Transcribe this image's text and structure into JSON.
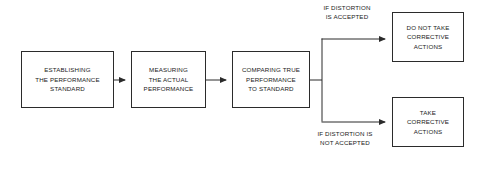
{
  "diagram": {
    "type": "flowchart",
    "orientation": "left-to-right",
    "background_color": "#ffffff",
    "line_color": "#2b2b2b",
    "text_color": "#1a1a1a",
    "nodes": [
      {
        "id": "establish",
        "shape": "rectangle",
        "lines": [
          "ESTABLISHING",
          "THE PERFORMANCE",
          "STANDARD"
        ]
      },
      {
        "id": "measure",
        "shape": "rectangle",
        "lines": [
          "MEASURING",
          "THE ACTUAL",
          "PERFORMANCE"
        ]
      },
      {
        "id": "compare",
        "shape": "rectangle",
        "lines": [
          "COMPARING TRUE",
          "PERFORMANCE",
          "TO STANDARD"
        ]
      },
      {
        "id": "no_action",
        "shape": "rectangle",
        "lines": [
          "DO NOT TAKE",
          "CORRECTIVE",
          "ACTIONS"
        ]
      },
      {
        "id": "action",
        "shape": "rectangle",
        "lines": [
          "TAKE",
          "CORRECTIVE",
          "ACTIONS"
        ]
      }
    ],
    "edge_labels": [
      {
        "id": "accepted",
        "lines": [
          "IF DISTORTION",
          "IS ACCEPTED"
        ]
      },
      {
        "id": "not_accepted",
        "lines": [
          "IF DISTORTION IS",
          "NOT ACCEPTED"
        ]
      }
    ],
    "connectors": [
      {
        "id": "establish-to-measure",
        "from": "establish",
        "to": "measure",
        "style": "arrow"
      },
      {
        "id": "measure-to-compare",
        "from": "measure",
        "to": "compare",
        "style": "arrow"
      },
      {
        "id": "compare-to-branch",
        "from": "compare",
        "to": "branch-trunk",
        "style": "line"
      },
      {
        "id": "branch-to-no-action",
        "from": "branch-trunk",
        "to": "no_action",
        "style": "arrow"
      },
      {
        "id": "branch-to-action",
        "from": "branch-trunk",
        "to": "action",
        "style": "arrow"
      }
    ]
  }
}
